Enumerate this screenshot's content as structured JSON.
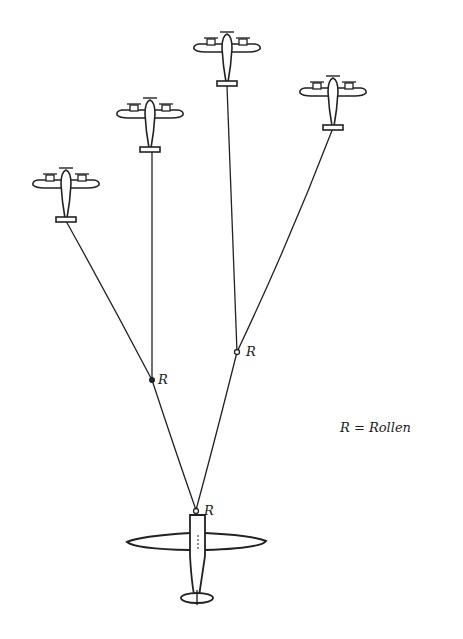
{
  "diagram": {
    "title": "",
    "legend": {
      "text": "R = Rollen"
    },
    "labels": {
      "r1": "R",
      "r2": "R",
      "r3": "R"
    },
    "nodes": [
      {
        "id": "tow-plane",
        "type": "large-aircraft"
      },
      {
        "id": "glider-1",
        "type": "twin-engine-aircraft"
      },
      {
        "id": "glider-2",
        "type": "twin-engine-aircraft"
      },
      {
        "id": "glider-3",
        "type": "twin-engine-aircraft"
      },
      {
        "id": "glider-4",
        "type": "twin-engine-aircraft"
      },
      {
        "id": "roller-1",
        "label": "R"
      },
      {
        "id": "roller-2",
        "label": "R"
      },
      {
        "id": "roller-3",
        "label": "R"
      }
    ],
    "edges": [
      {
        "from": "tow-plane",
        "to": "roller-3"
      },
      {
        "from": "roller-3",
        "to": "roller-1"
      },
      {
        "from": "roller-3",
        "to": "roller-2"
      },
      {
        "from": "roller-1",
        "to": "glider-1"
      },
      {
        "from": "roller-1",
        "to": "glider-2"
      },
      {
        "from": "roller-2",
        "to": "glider-3"
      },
      {
        "from": "roller-2",
        "to": "glider-4"
      }
    ]
  }
}
